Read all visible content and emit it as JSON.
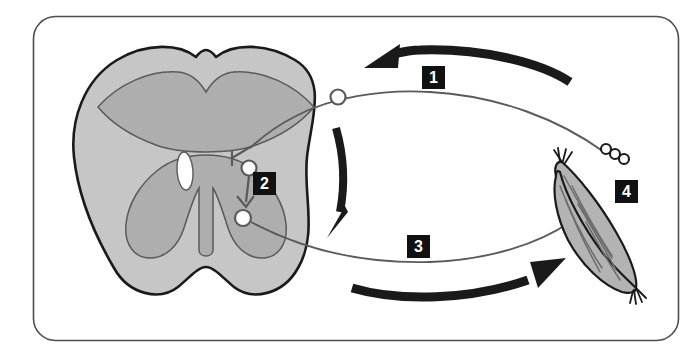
{
  "figure": {
    "background_color": "#ffffff",
    "frame": {
      "name": "rounded-rectangle-border",
      "stroke_color": "#4d4d4d",
      "corner_radius": 22,
      "x": 33,
      "y": 16,
      "width": 645,
      "height": 324
    }
  },
  "callouts": [
    {
      "id": "1",
      "label": "1",
      "meaning": "sensory-afferent-direction",
      "x": 422,
      "y": 66,
      "box_color": "#111111",
      "text_color": "#ffffff"
    },
    {
      "id": "2",
      "label": "2",
      "meaning": "interneuron-in-gray-matter",
      "x": 253,
      "y": 172,
      "box_color": "#111111",
      "text_color": "#ffffff"
    },
    {
      "id": "3",
      "label": "3",
      "meaning": "motor-efferent-direction",
      "x": 407,
      "y": 235,
      "box_color": "#111111",
      "text_color": "#ffffff"
    },
    {
      "id": "4",
      "label": "4",
      "meaning": "skeletal-muscle-effector",
      "x": 615,
      "y": 180,
      "box_color": "#111111",
      "text_color": "#ffffff"
    }
  ],
  "structures": {
    "spinal_cord": {
      "name": "spinal-cord-cross-section",
      "white_matter_color": "#c6c6c6",
      "gray_matter_color": "#aeaeae",
      "outline_color": "#1a1a1a",
      "inner_outline_color": "#5a5a5a",
      "central_canal_color": "#ffffff"
    },
    "muscle": {
      "name": "skeletal-muscle",
      "fill_color": "#b3b3b3",
      "outline_color": "#1a1a1a",
      "fiber_line_color": "#6b6b6b"
    },
    "sensory_neuron": {
      "name": "sensory-afferent-neuron",
      "line_color": "#5a5a5a",
      "cell_body_x": 337,
      "cell_body_y": 97,
      "receptor_circles": 3
    },
    "motor_neuron": {
      "name": "motor-efferent-neuron",
      "line_color": "#5a5a5a",
      "cell_body_x": 243,
      "cell_body_y": 217
    },
    "interneuron": {
      "name": "interneuron",
      "line_color": "#5a5a5a",
      "upper_soma_x": 249,
      "upper_soma_y": 168,
      "lower_soma_x": 243,
      "lower_soma_y": 217
    }
  },
  "arrows": [
    {
      "name": "arrow-sensory-toward-cord",
      "direction": "leftward",
      "color": "#1a1a1a",
      "associated_callout": "1"
    },
    {
      "name": "arrow-descending-within-cord",
      "direction": "downward",
      "color": "#1a1a1a",
      "associated_callout": "2"
    },
    {
      "name": "arrow-motor-toward-muscle",
      "direction": "rightward",
      "color": "#1a1a1a",
      "associated_callout": "3"
    }
  ]
}
